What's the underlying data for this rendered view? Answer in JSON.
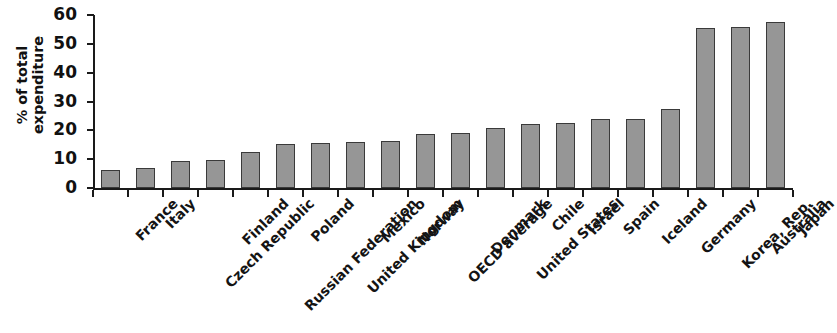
{
  "chart_data": {
    "type": "bar",
    "title": "",
    "subtitle": "",
    "xlabel": "",
    "ylabel": "% of total expenditure",
    "ylabel_lines": [
      "% of total",
      "expenditure"
    ],
    "ylim": [
      0,
      60
    ],
    "yticks": [
      0,
      10,
      20,
      30,
      40,
      50,
      60
    ],
    "ytick_labels": [
      "0",
      "10",
      "20",
      "30",
      "40",
      "50",
      "60"
    ],
    "grid": false,
    "legend": null,
    "bar_color": "#969696",
    "bar_edge_color": "#3a3a3a",
    "axis_color": "#1a1a1a",
    "categories": [
      "France",
      "Italy",
      "Czech Republic",
      "Finland",
      "Russian Federation",
      "Poland",
      "United Kingdom",
      "Mexico",
      "Norway",
      "OECD average",
      "Denmark",
      "United States",
      "Chile",
      "Israel",
      "Spain",
      "Iceland",
      "Germany",
      "Korea, Rep.",
      "Australia",
      "Japan"
    ],
    "values": [
      6.2,
      7.0,
      9.2,
      9.8,
      12.5,
      15.3,
      15.7,
      15.8,
      16.3,
      18.7,
      19.2,
      20.7,
      22.2,
      22.7,
      23.8,
      24.0,
      27.5,
      55.5,
      56.0,
      57.5
    ]
  }
}
